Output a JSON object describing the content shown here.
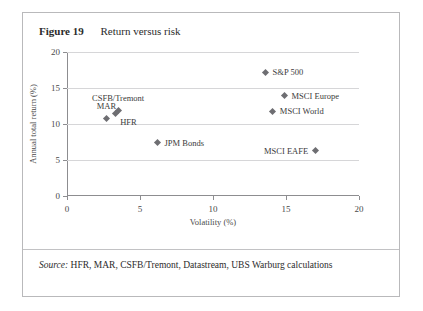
{
  "figure": {
    "label": "Figure 19",
    "title": "Return versus risk",
    "source_prefix": "Source:",
    "source_text": " HFR, MAR, CSFB/Tremont, Datastream, UBS Warburg calculations"
  },
  "chart_data": {
    "type": "scatter",
    "title": "Return versus risk",
    "xlabel": "Volatility (%)",
    "ylabel": "Annual total return (%)",
    "xlim": [
      0,
      20
    ],
    "ylim": [
      0,
      20
    ],
    "xticks": [
      "0",
      "5",
      "10",
      "15",
      "20"
    ],
    "yticks": [
      "0",
      "5",
      "10",
      "15",
      "20"
    ],
    "xtick_values": [
      0,
      5,
      10,
      15,
      20
    ],
    "ytick_values": [
      0,
      5,
      10,
      15,
      20
    ],
    "grid": "horizontal",
    "legend": "none",
    "marker_shape": "diamond",
    "marker_color": "#6e6e72",
    "points": [
      {
        "name": "MAR",
        "x": 2.7,
        "y": 10.8,
        "label_pos": "above"
      },
      {
        "name": "CSFB/Tremont",
        "x": 3.5,
        "y": 11.9,
        "label_pos": "above"
      },
      {
        "name": "HFR",
        "x": 3.3,
        "y": 11.4,
        "label_pos": "below-right"
      },
      {
        "name": "JPM Bonds",
        "x": 6.2,
        "y": 7.4,
        "label_pos": "right"
      },
      {
        "name": "S&P 500",
        "x": 13.6,
        "y": 17.2,
        "label_pos": "right"
      },
      {
        "name": "MSCI Europe",
        "x": 14.9,
        "y": 13.9,
        "label_pos": "right"
      },
      {
        "name": "MSCI World",
        "x": 14.1,
        "y": 11.8,
        "label_pos": "right"
      },
      {
        "name": "MSCI EAFE",
        "x": 17.0,
        "y": 6.3,
        "label_pos": "left"
      }
    ]
  }
}
